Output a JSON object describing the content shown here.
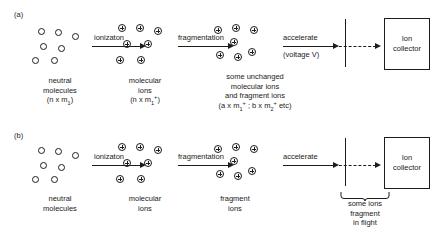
{
  "figure": {
    "type": "mass-spectrometry-process-diagram",
    "panels": [
      {
        "id": "a",
        "label": "(a)",
        "stages": [
          {
            "name": "neutral-molecules",
            "particle_symbol": "open-circle",
            "particle_count": 7,
            "caption_lines": [
              "neutral",
              "molecules"
            ],
            "formula_prefix": "(n x m",
            "formula_sub": "1",
            "formula_sup": "",
            "formula_suffix": ")"
          },
          {
            "name": "molecular-ions",
            "particle_symbol": "circled-plus",
            "particle_count": 7,
            "caption_lines": [
              "molecular",
              "ions"
            ],
            "formula_prefix": "(n x m",
            "formula_sub": "1",
            "formula_sup": "+",
            "formula_suffix": ")"
          },
          {
            "name": "mixed-ions",
            "particle_symbol": "circled-plus",
            "particle_count": 7,
            "caption_lines": [
              "some unchanged",
              "molecular ions",
              "and fragment ions"
            ],
            "formula_a_prefix": "(a x m",
            "formula_a_sub": "1",
            "formula_a_sup": "+",
            "formula_sep": " ; b x m",
            "formula_b_sub": "2",
            "formula_b_sup": "+",
            "formula_b_suffix": " etc)"
          }
        ],
        "arrows": [
          {
            "name": "ionization-arrow",
            "label": "ionizaton",
            "sublabel": ""
          },
          {
            "name": "fragmentation-arrow",
            "label": "fragmentation",
            "sublabel": ""
          },
          {
            "name": "accelerate-arrow",
            "label": "accelerate",
            "sublabel": "(voltage V)"
          }
        ],
        "collector": {
          "name": "ion-collector",
          "line1": "Ion",
          "line2": "collector"
        },
        "note": ""
      },
      {
        "id": "b",
        "label": "(b)",
        "stages": [
          {
            "name": "neutral-molecules",
            "particle_symbol": "open-circle",
            "particle_count": 7,
            "caption_lines": [
              "neutral",
              "molecules"
            ],
            "formula_prefix": "",
            "formula_sub": "",
            "formula_sup": "",
            "formula_suffix": ""
          },
          {
            "name": "molecular-ions",
            "particle_symbol": "circled-plus",
            "particle_count": 7,
            "caption_lines": [
              "molecular",
              "ions"
            ],
            "formula_prefix": "",
            "formula_sub": "",
            "formula_sup": "",
            "formula_suffix": ""
          },
          {
            "name": "fragment-ions",
            "particle_symbol": "circled-plus",
            "particle_count": 7,
            "caption_lines": [
              "fragment",
              "ions"
            ],
            "formula_prefix": "",
            "formula_sub": "",
            "formula_sup": "",
            "formula_suffix": ""
          }
        ],
        "arrows": [
          {
            "name": "ionization-arrow",
            "label": "ionizaton",
            "sublabel": ""
          },
          {
            "name": "fragmentation-arrow",
            "label": "fragmentation",
            "sublabel": ""
          },
          {
            "name": "accelerate-arrow",
            "label": "accelerate",
            "sublabel": ""
          }
        ],
        "collector": {
          "name": "ion-collector",
          "line1": "Ion",
          "line2": "collector"
        },
        "note_lines": [
          "some ions",
          "fragment",
          "in flight"
        ]
      }
    ],
    "colors": {
      "ink": "#1c1c1c",
      "background": "#ffffff"
    }
  }
}
